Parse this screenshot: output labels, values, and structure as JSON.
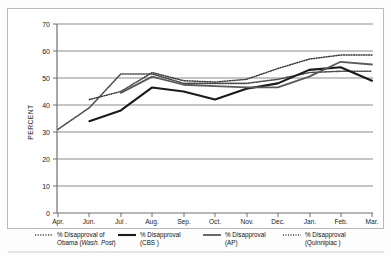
{
  "chart": {
    "yaxis_title": "PERCENT",
    "ytick_labels": [
      "0",
      "10",
      "20",
      "30",
      "40",
      "50",
      "60",
      "70"
    ],
    "xtick_labels": [
      "Apr.",
      "Jun.",
      "Jul .",
      "Aug.",
      "Sep.",
      "Oct.",
      "Nov.",
      "Dec.",
      "Jan.",
      "Feb.",
      "Mar."
    ]
  },
  "legend": {
    "items": [
      {
        "style": "dotted",
        "line1": "% Disapproval of",
        "line2_pre": "Obama (",
        "line2_em": "Wash. Post",
        "line2_post": ")"
      },
      {
        "style": "solid-thick",
        "line1": "% Disapproval",
        "line2_pre": "(CBS )",
        "line2_em": "",
        "line2_post": ""
      },
      {
        "style": "solid",
        "line1": "% Disapproval",
        "line2_pre": "(AP)",
        "line2_em": "",
        "line2_post": ""
      },
      {
        "style": "dotted-fine",
        "line1": "% Disapproval",
        "line2_pre": "(Quinnipiac )",
        "line2_em": "",
        "line2_post": ""
      }
    ]
  },
  "chart_data": {
    "type": "line",
    "title": "",
    "xlabel": "",
    "ylabel": "PERCENT",
    "ylim": [
      0,
      70
    ],
    "yticks": [
      0,
      10,
      20,
      30,
      40,
      50,
      60,
      70
    ],
    "grid": true,
    "legend_position": "bottom",
    "categories": [
      "Apr.",
      "Jun.",
      "Jul .",
      "Aug.",
      "Sep.",
      "Oct.",
      "Nov.",
      "Dec.",
      "Jan.",
      "Feb.",
      "Mar."
    ],
    "series": [
      {
        "name": "% Disapproval of Obama (Wash. Post)",
        "style": "dotted",
        "color": "#4c4c4c",
        "values": [
          31,
          39,
          51.5,
          51.5,
          48,
          48,
          48,
          49.5,
          52,
          52.5,
          52.5
        ]
      },
      {
        "name": "% Disapproval (CBS)",
        "style": "solid-thick",
        "color": "#1a1a1a",
        "values": [
          null,
          34,
          38,
          46.5,
          45,
          42,
          46,
          48,
          53,
          54,
          49
        ]
      },
      {
        "name": "% Disapproval (AP)",
        "style": "solid",
        "color": "#5a5a5a",
        "values": [
          null,
          null,
          44.5,
          50.5,
          47.5,
          47,
          46.5,
          46.5,
          50.5,
          56,
          55
        ]
      },
      {
        "name": "% Disapproval (Quinnipiac)",
        "style": "dotted-fine",
        "color": "#3a3a3a",
        "values": [
          null,
          42,
          45,
          52,
          49,
          48.5,
          49.5,
          53.5,
          57,
          58.5,
          58.5
        ]
      }
    ]
  }
}
